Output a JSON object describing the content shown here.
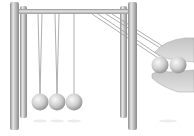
{
  "scene": {
    "subject": "Newton's cradle",
    "description": "A Newton's cradle with three balls hanging at rest and two balls held pulled back by a hand on the right",
    "colors": {
      "background": "#ffffff",
      "frame": "#a9a9a9",
      "frame_highlight": "#e4e4e4",
      "ball": "#c8c8c8",
      "ball_highlight": "#f4f4f4",
      "hand": "#d4d4d4",
      "string": "#9a9a9a"
    },
    "balls_at_rest": 3,
    "balls_pulled": 2
  }
}
